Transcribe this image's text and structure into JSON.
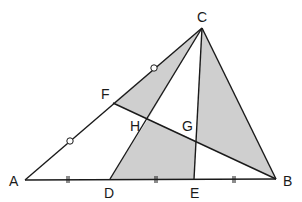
{
  "diagram": {
    "type": "geometry",
    "fill_color": "#cfcfcf",
    "stroke_color": "#1a1a1a",
    "points": {
      "A": {
        "label": "A",
        "x": 25,
        "y": 180
      },
      "B": {
        "label": "B",
        "x": 276,
        "y": 179
      },
      "C": {
        "label": "C",
        "x": 202,
        "y": 28
      },
      "D": {
        "label": "D",
        "x": 110,
        "y": 179
      },
      "E": {
        "label": "E",
        "x": 194,
        "y": 179
      },
      "F": {
        "label": "F",
        "x": 113,
        "y": 103
      },
      "G": {
        "label": "G",
        "x": 196,
        "y": 141
      },
      "H": {
        "label": "H",
        "x": 148,
        "y": 119
      }
    },
    "segments": [
      "AB",
      "AC",
      "BC",
      "CD",
      "CE",
      "FB"
    ],
    "shaded_regions": [
      "CFH",
      "DHGE",
      "CGB"
    ],
    "equal_marks": {
      "circle": [
        "AF",
        "FC"
      ],
      "double_tick": [
        "AD",
        "DE",
        "EB"
      ]
    }
  }
}
